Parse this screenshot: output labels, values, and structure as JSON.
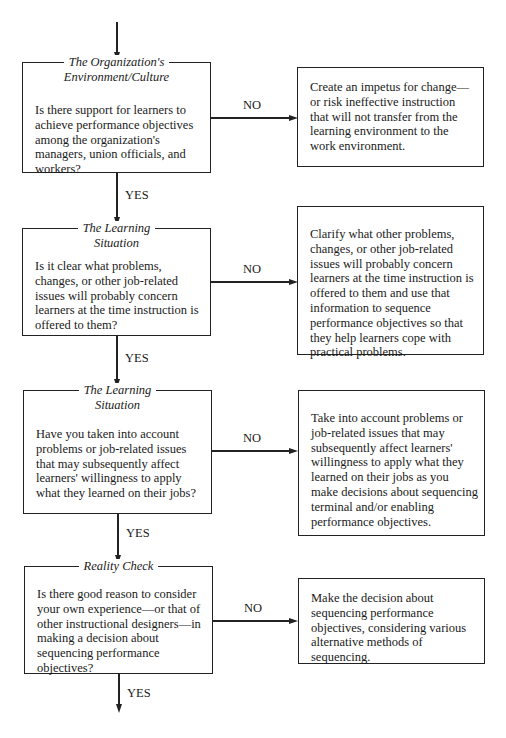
{
  "flowchart": {
    "steps": [
      {
        "title_line1": "The Organization's",
        "title_line2": "Environment/Culture",
        "question": "Is there support for learners to achieve performance objectives among the organization's managers, union officials, and workers?",
        "no_label": "NO",
        "no_action": "Create an impetus for change—or risk ineffective instruction that will not transfer from the learning environment to the work environment.",
        "yes_label": "YES"
      },
      {
        "title_line1": "The Learning",
        "title_line2": "Situation",
        "question": "Is it clear what problems, changes, or other job-related issues will probably concern learners at the time instruction is offered to them?",
        "no_label": "NO",
        "no_action": "Clarify what other problems, changes, or other job-related issues will probably concern learners at the time instruction is offered to them and use that information to sequence performance objectives so that they help learners cope with practical problems.",
        "yes_label": "YES"
      },
      {
        "title_line1": "The Learning",
        "title_line2": "Situation",
        "question": "Have you taken into account problems or job-related issues that may subsequently affect learners' willingness to apply what they learned on their jobs?",
        "no_label": "NO",
        "no_action": "Take into account problems or job-related issues that may subsequently affect learners' willingness to apply what they learned on their jobs as you make decisions about sequencing terminal and/or enabling performance objectives.",
        "yes_label": "YES"
      },
      {
        "title_line1": "Reality Check",
        "title_line2": "",
        "question": "Is there good reason to consider your own experience—or that of other instructional designers—in making a decision about sequencing performance objectives?",
        "no_label": "NO",
        "no_action": "Make the decision about sequencing performance objectives, considering various alternative methods of sequencing.",
        "yes_label": "YES"
      }
    ]
  }
}
